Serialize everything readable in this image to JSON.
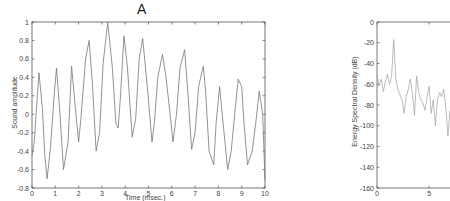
{
  "chart_data": [
    {
      "type": "line",
      "title": "A",
      "xlabel": "Time (msec.)",
      "ylabel": "Sound amplitude",
      "xlim": [
        0,
        10
      ],
      "ylim": [
        -0.8,
        1
      ],
      "xticks": [
        0,
        1,
        2,
        3,
        4,
        5,
        6,
        7,
        8,
        9,
        10
      ],
      "yticks": [
        -0.8,
        -0.6,
        -0.4,
        -0.2,
        0,
        0.2,
        0.4,
        0.6,
        0.8,
        1
      ],
      "ytick_labels": [
        "-0.8",
        "-0.6",
        "-0.4",
        "-0.2",
        "0",
        "0.2",
        "0.4",
        "0.6",
        "0.8",
        "1"
      ],
      "grid": false,
      "line_color": "#777777",
      "series": [
        {
          "name": "waveform",
          "x": [
            0,
            0.1,
            0.2,
            0.3,
            0.45,
            0.55,
            0.65,
            0.8,
            0.95,
            1.05,
            1.2,
            1.35,
            1.55,
            1.7,
            1.85,
            2.0,
            2.1,
            2.3,
            2.45,
            2.6,
            2.75,
            2.9,
            3.05,
            3.25,
            3.45,
            3.6,
            3.7,
            3.8,
            3.95,
            4.1,
            4.3,
            4.45,
            4.6,
            4.75,
            4.95,
            5.15,
            5.25,
            5.4,
            5.6,
            5.75,
            5.95,
            6.05,
            6.2,
            6.35,
            6.55,
            6.7,
            6.85,
            7.0,
            7.15,
            7.35,
            7.45,
            7.6,
            7.8,
            7.9,
            8.05,
            8.2,
            8.4,
            8.55,
            8.7,
            8.85,
            9.0,
            9.1,
            9.25,
            9.45,
            9.6,
            9.75,
            9.9,
            10.0
          ],
          "y": [
            -0.45,
            -0.3,
            0.1,
            0.45,
            0.05,
            -0.45,
            -0.7,
            -0.35,
            0.2,
            0.5,
            0.0,
            -0.6,
            -0.3,
            0.52,
            0.1,
            -0.3,
            -0.05,
            0.6,
            0.8,
            0.3,
            -0.4,
            -0.2,
            0.55,
            1.0,
            0.5,
            -0.1,
            -0.15,
            0.2,
            0.85,
            0.5,
            -0.25,
            -0.05,
            0.6,
            0.82,
            0.3,
            -0.3,
            -0.1,
            0.4,
            0.65,
            0.4,
            -0.05,
            -0.3,
            0.0,
            0.5,
            0.7,
            0.2,
            -0.38,
            -0.2,
            0.3,
            0.52,
            0.25,
            -0.4,
            -0.55,
            -0.1,
            0.3,
            -0.1,
            -0.6,
            -0.4,
            0.0,
            0.38,
            0.3,
            -0.1,
            -0.55,
            -0.4,
            -0.1,
            0.25,
            0.0,
            -0.72
          ]
        }
      ]
    },
    {
      "type": "line",
      "title": "",
      "xlabel": "",
      "ylabel": "Energy Spectral Density (dB)",
      "xlim": [
        0,
        7
      ],
      "ylim": [
        -160,
        0
      ],
      "xticks": [
        0,
        5
      ],
      "yticks": [
        -160,
        -140,
        -120,
        -100,
        -80,
        -60,
        -40,
        -20,
        0
      ],
      "ytick_labels": [
        "-160",
        "-140",
        "-120",
        "-100",
        "-80",
        "-60",
        "-40",
        "-20",
        "0"
      ],
      "grid": false,
      "line_color": "#aaaaaa",
      "series": [
        {
          "name": "spectrum",
          "x": [
            0,
            0.2,
            0.4,
            0.6,
            0.8,
            1.0,
            1.2,
            1.4,
            1.6,
            1.8,
            2.0,
            2.2,
            2.4,
            2.6,
            2.8,
            3.0,
            3.2,
            3.4,
            3.6,
            3.8,
            4.0,
            4.2,
            4.4,
            4.6,
            4.8,
            5.0,
            5.2,
            5.4,
            5.6,
            5.8,
            6.0,
            6.2,
            6.4,
            6.6,
            6.8,
            7.0
          ],
          "y": [
            -50,
            -62,
            -55,
            -67,
            -58,
            -50,
            -60,
            -52,
            -17,
            -55,
            -65,
            -70,
            -75,
            -88,
            -72,
            -65,
            -55,
            -70,
            -90,
            -52,
            -68,
            -75,
            -78,
            -85,
            -72,
            -62,
            -88,
            -75,
            -100,
            -75,
            -68,
            -72,
            -65,
            -82,
            -110,
            -85
          ]
        }
      ]
    }
  ],
  "left_plot": {
    "title": "A",
    "xlabel": "Time (msec.)",
    "ylabel": "Sound amplitude"
  },
  "right_plot": {
    "ylabel": "Energy Spectral Density (dB)"
  }
}
